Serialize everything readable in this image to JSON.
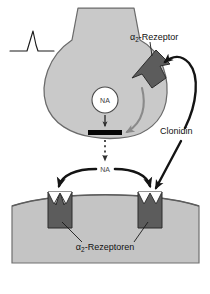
{
  "figure": {
    "background_color": "#ffffff"
  },
  "colors": {
    "neuron_fill": "#c9c9c9",
    "neuron_stroke": "#6b6b6b",
    "postsynaptic_fill": "#c4c4c4",
    "postsynaptic_stroke": "#707070",
    "receptor_fill": "#5c5c5c",
    "receptor_stroke": "#2b2b2b",
    "arrow_black": "#141414",
    "arrow_gray": "#8a8a8a",
    "vesicle_fill": "#ffffff",
    "vesicle_stroke": "#4a4a4a",
    "active_zone": "#050505",
    "text": "#111111"
  },
  "labels": {
    "alpha2_receptor": {
      "prefix": "α",
      "subscript": "2",
      "suffix": "-Rezeptor",
      "full": "α2-Rezeptor"
    },
    "alpha2_receptors_post": {
      "prefix": "α",
      "subscript": "2",
      "suffix": "-Rezeptoren",
      "full": "α2-Rezeptoren"
    },
    "clonidin": "Clonidin",
    "na_vesicle": "NA",
    "na_cleft": "NA"
  },
  "elements": {
    "action_potential": "action-potential-spike",
    "presynaptic_terminal": "presynaptic-nerve-terminal",
    "vesicle": "noradrenaline-vesicle",
    "active_zone_bar": "active-zone-release-site",
    "release_arrow": "vesicle-release-arrow",
    "cleft_arrow": "synaptic-cleft-dotted-arrow",
    "autoreceptor": "presynaptic-alpha2-autoreceptor",
    "feedback_arrow": "negative-feedback-arrow",
    "clonidin_arrow_pre": "clonidin-to-presynaptic-receptor-arrow",
    "clonidin_arrow_post": "clonidin-to-postsynaptic-receptor-arrow",
    "na_branch_arrow_left": "na-to-left-postsynaptic-receptor-arrow",
    "na_branch_arrow_right": "na-to-right-postsynaptic-receptor-arrow",
    "postsynaptic_cell": "postsynaptic-effector-cell",
    "receptor_left": "postsynaptic-alpha2-receptor-left",
    "receptor_right": "postsynaptic-alpha2-receptor-right",
    "leader_left": "receptor-label-leader-left",
    "leader_right": "receptor-label-leader-right"
  }
}
